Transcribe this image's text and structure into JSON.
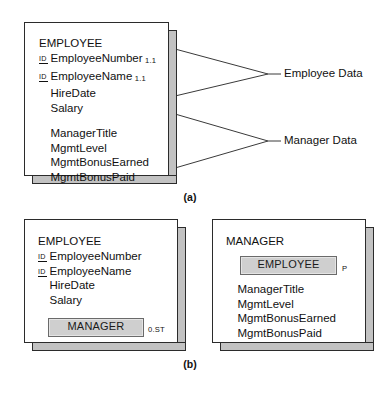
{
  "figure": {
    "part_a_caption": "(a)",
    "part_b_caption": "(b)"
  },
  "part_a": {
    "entity": {
      "name": "EMPLOYEE",
      "attributes": [
        {
          "id_mark": "ID",
          "name": "EmployeeNumber",
          "cardinality": "1.1"
        },
        {
          "id_mark": "ID",
          "name": "EmployeeName",
          "cardinality": "1.1"
        },
        {
          "id_mark": "",
          "name": "HireDate",
          "cardinality": ""
        },
        {
          "id_mark": "",
          "name": "Salary",
          "cardinality": ""
        },
        {
          "id_mark": "",
          "name": "",
          "cardinality": ""
        },
        {
          "id_mark": "",
          "name": "ManagerTitle",
          "cardinality": ""
        },
        {
          "id_mark": "",
          "name": "MgmtLevel",
          "cardinality": ""
        },
        {
          "id_mark": "",
          "name": "MgmtBonusEarned",
          "cardinality": ""
        },
        {
          "id_mark": "",
          "name": "MgmtBonusPaid",
          "cardinality": ""
        }
      ]
    },
    "callouts": [
      {
        "label": "Employee Data"
      },
      {
        "label": "Manager Data"
      }
    ]
  },
  "part_b": {
    "left_entity": {
      "name": "EMPLOYEE",
      "attributes": [
        {
          "id_mark": "ID",
          "name": "EmployeeNumber"
        },
        {
          "id_mark": "ID",
          "name": "EmployeeName"
        },
        {
          "id_mark": "",
          "name": "HireDate"
        },
        {
          "id_mark": "",
          "name": "Salary"
        }
      ],
      "nested": {
        "label": "MANAGER",
        "cardinality": "0.ST"
      }
    },
    "right_entity": {
      "name": "MANAGER",
      "nested": {
        "label": "EMPLOYEE",
        "cardinality": "P"
      },
      "attributes": [
        {
          "id_mark": "",
          "name": "ManagerTitle"
        },
        {
          "id_mark": "",
          "name": "MgmtLevel"
        },
        {
          "id_mark": "",
          "name": "MgmtBonusEarned"
        },
        {
          "id_mark": "",
          "name": "MgmtBonusPaid"
        }
      ]
    }
  },
  "colors": {
    "outline": "#2b2b2b",
    "extrusion": "#c2c2c2",
    "nested_fill": "#cfcfcf",
    "background": "#ffffff"
  }
}
